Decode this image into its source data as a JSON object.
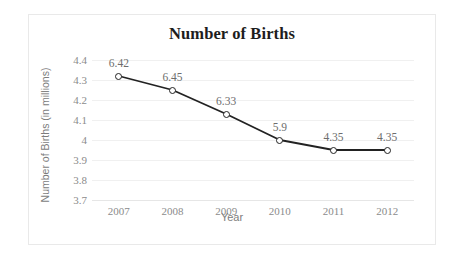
{
  "chart_data": {
    "type": "line",
    "title": "Number of Births",
    "xlabel": "Year",
    "ylabel": "Number of Births (in millions)",
    "categories": [
      "2007",
      "2008",
      "2009",
      "2010",
      "2011",
      "2012"
    ],
    "values": [
      4.32,
      4.25,
      4.13,
      4.0,
      3.95,
      3.95
    ],
    "data_labels": [
      "6.42",
      "6.45",
      "6.33",
      "5.9",
      "4.35",
      "4.35"
    ],
    "yticks": [
      "4.4",
      "4.3",
      "4.2",
      "4.1",
      "4",
      "3.9",
      "3.8",
      "3.7"
    ],
    "ytick_values": [
      4.4,
      4.3,
      4.2,
      4.1,
      4.0,
      3.9,
      3.8,
      3.7
    ],
    "ylim": [
      3.7,
      4.4
    ],
    "grid": true,
    "legend": false,
    "series_color": "#222222",
    "marker_fill": "#ffffff",
    "grid_color": "#f0f0f0",
    "text_color": "#7d7d7d",
    "title_color": "#1d1d1d"
  }
}
